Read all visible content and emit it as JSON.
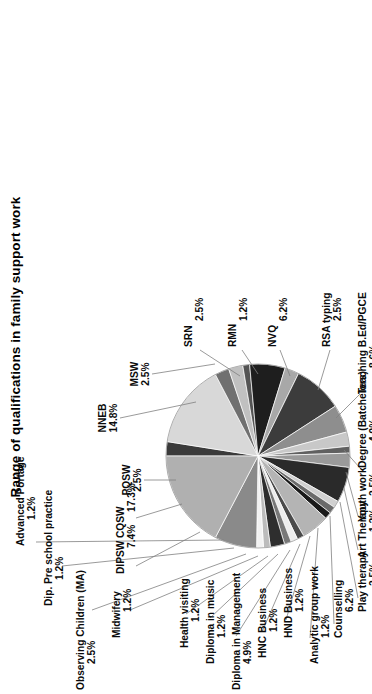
{
  "chart_data": {
    "type": "pie",
    "title": "Range of qualifications in family support work",
    "xlabel": "",
    "ylabel": "",
    "legend_position": "none",
    "grid": false,
    "labels_show_percent": true,
    "rotation_degrees": -90,
    "categories": [
      "PQSW",
      "NNEB",
      "MSW",
      "SRN",
      "RMN",
      "NVQ",
      "RSA typing",
      "Teaching B.Ed/PGCE",
      "Degree (Batchelors)",
      "Youth work",
      "Art Therapy",
      "Play therapy",
      "Counselling",
      "Analytic group work",
      "HND Business",
      "HNC Business",
      "Diploma in Management",
      "Diploma in music",
      "Health visiting",
      "Midwifery",
      "Observing Children (MA)",
      "Dip. Pre school practice",
      "Advanced Portage",
      "DIPSW",
      "CQSW"
    ],
    "values": [
      2.5,
      14.8,
      2.5,
      2.5,
      1.2,
      6.2,
      2.5,
      8.6,
      4.9,
      2.5,
      1.2,
      2.5,
      6.2,
      1.2,
      1.2,
      1.2,
      4.9,
      1.2,
      1.2,
      1.2,
      2.5,
      1.2,
      1.2,
      7.4,
      17.3
    ],
    "value_suffix": "%",
    "slices": [
      {
        "label": "PQSW",
        "value": 2.5,
        "pct_text": "2.5%",
        "color": "#3a3a3a"
      },
      {
        "label": "NNEB",
        "value": 14.8,
        "pct_text": "14.8%",
        "color": "#d8d8d8"
      },
      {
        "label": "MSW",
        "value": 2.5,
        "pct_text": "2.5%",
        "color": "#707070"
      },
      {
        "label": "SRN",
        "value": 2.5,
        "pct_text": "2.5%",
        "color": "#c0c0c0"
      },
      {
        "label": "RMN",
        "value": 1.2,
        "pct_text": "1.2%",
        "color": "#545454"
      },
      {
        "label": "NVQ",
        "value": 6.2,
        "pct_text": "6.2%",
        "color": "#1e1e1e"
      },
      {
        "label": "RSA typing",
        "value": 2.5,
        "pct_text": "2.5%",
        "color": "#a8a8a8"
      },
      {
        "label": "Teaching B.Ed/PGCE",
        "value": 8.6,
        "pct_text": "8.6%",
        "color": "#3c3c3c"
      },
      {
        "label": "Degree (Batchelors)",
        "value": 4.9,
        "pct_text": "4.9%",
        "color": "#8e8e8e"
      },
      {
        "label": "Youth work",
        "value": 2.5,
        "pct_text": "2.5%",
        "color": "#c8c8c8"
      },
      {
        "label": "Art Therapy",
        "value": 1.2,
        "pct_text": "1.2%",
        "color": "#606060"
      },
      {
        "label": "Play therapy",
        "value": 2.5,
        "pct_text": "2.5%",
        "color": "#9a9a9a"
      },
      {
        "label": "Counselling",
        "value": 6.2,
        "pct_text": "6.2%",
        "color": "#2a2a2a"
      },
      {
        "label": "Analytic group work",
        "value": 1.2,
        "pct_text": "1.2%",
        "color": "#d0d0d0"
      },
      {
        "label": "HND Business",
        "value": 1.2,
        "pct_text": "1.2%",
        "color": "#6a6a6a"
      },
      {
        "label": "HNC Business",
        "value": 1.2,
        "pct_text": "1.2%",
        "color": "#1a1a1a"
      },
      {
        "label": "Diploma in Management",
        "value": 4.9,
        "pct_text": "4.9%",
        "color": "#b4b4b4"
      },
      {
        "label": "Diploma in music",
        "value": 1.2,
        "pct_text": "1.2%",
        "color": "#4a4a4a"
      },
      {
        "label": "Health visiting",
        "value": 1.2,
        "pct_text": "1.2%",
        "color": "#ededed"
      },
      {
        "label": "Midwifery",
        "value": 1.2,
        "pct_text": "1.2%",
        "color": "#787878"
      },
      {
        "label": "Observing Children (MA)",
        "value": 2.5,
        "pct_text": "2.5%",
        "color": "#2e2e2e"
      },
      {
        "label": "Dip. Pre school practice",
        "value": 1.2,
        "pct_text": "1.2%",
        "color": "#bcbcbc"
      },
      {
        "label": "Advanced Portage",
        "value": 1.2,
        "pct_text": "1.2%",
        "color": "#f2f2f2"
      },
      {
        "label": "DIPSW",
        "value": 7.4,
        "pct_text": "7.4%",
        "color": "#8a8a8a"
      },
      {
        "label": "CQSW",
        "value": 17.3,
        "pct_text": "17.3%",
        "color": "#b0b0b0"
      }
    ]
  },
  "labels": [
    {
      "id": "pqsw",
      "name": "PQSW",
      "pct": "2.5%",
      "x": 214,
      "y": 130,
      "anchor": "middle",
      "lx1": 214,
      "ly1": 144,
      "lx2": 214,
      "ly2": 176
    },
    {
      "id": "nneb",
      "name": "NNEB",
      "pct": "14.8%",
      "x": 276,
      "y": 106,
      "anchor": "middle",
      "lx1": 276,
      "ly1": 120,
      "lx2": 292,
      "ly2": 196
    },
    {
      "id": "msw",
      "name": "MSW",
      "pct": "2.5%",
      "x": 320,
      "y": 138,
      "anchor": "middle",
      "lx1": 320,
      "ly1": 152,
      "lx2": 330,
      "ly2": 215
    },
    {
      "id": "srn",
      "name": "SRN",
      "pct": "2.5%",
      "x": 347,
      "y": 192,
      "anchor": "start",
      "lx1": 344,
      "ly1": 200,
      "lx2": 318,
      "ly2": 240
    },
    {
      "id": "rmn",
      "name": "RMN",
      "pct": "1.2%",
      "x": 347,
      "y": 236,
      "anchor": "start",
      "lx1": 344,
      "ly1": 242,
      "lx2": 320,
      "ly2": 258
    },
    {
      "id": "nvq",
      "name": "NVQ",
      "pct": "6.2%",
      "x": 347,
      "y": 276,
      "anchor": "start",
      "lx1": 344,
      "ly1": 280,
      "lx2": 318,
      "ly2": 290
    },
    {
      "id": "rsa-typing",
      "name": "RSA typing",
      "pct": "2.5%",
      "x": 347,
      "y": 330,
      "anchor": "start",
      "lx1": 344,
      "ly1": 330,
      "lx2": 304,
      "ly2": 318
    },
    {
      "id": "teaching",
      "name": "Teaching B.Ed/PGCE",
      "pct": "8.6%",
      "x": 300,
      "y": 366,
      "anchor": "start",
      "lx1": 300,
      "ly1": 360,
      "lx2": 276,
      "ly2": 336
    },
    {
      "id": "degree",
      "name": "Degree (Batchelors)",
      "pct": "4.9%",
      "x": 226,
      "y": 366,
      "anchor": "start",
      "lx1": 226,
      "ly1": 360,
      "lx2": 244,
      "ly2": 344
    },
    {
      "id": "youth-work",
      "name": "Youth work",
      "pct": "2.5%",
      "x": 172,
      "y": 366,
      "anchor": "start",
      "lx1": 178,
      "ly1": 358,
      "lx2": 222,
      "ly2": 346
    },
    {
      "id": "art-therapy",
      "name": "Art Therapy",
      "pct": "1.2%",
      "x": 136,
      "y": 366,
      "anchor": "start",
      "lx1": 144,
      "ly1": 358,
      "lx2": 206,
      "ly2": 344
    },
    {
      "id": "play-therapy",
      "name": "Play therapy",
      "pct": "2.5%",
      "x": 82,
      "y": 366,
      "anchor": "start",
      "lx1": 96,
      "ly1": 358,
      "lx2": 192,
      "ly2": 340
    },
    {
      "id": "counselling",
      "name": "Counselling",
      "pct": "6.2%",
      "x": 56,
      "y": 342,
      "anchor": "start",
      "lx1": 70,
      "ly1": 334,
      "lx2": 178,
      "ly2": 330
    },
    {
      "id": "analytic",
      "name": "Analytic group work",
      "pct": "1.2%",
      "x": 30,
      "y": 318,
      "anchor": "start",
      "lx1": 56,
      "ly1": 310,
      "lx2": 166,
      "ly2": 318
    },
    {
      "id": "hnd-business",
      "name": "HND Business",
      "pct": "1.2%",
      "x": 56,
      "y": 292,
      "anchor": "start",
      "lx1": 74,
      "ly1": 286,
      "lx2": 158,
      "ly2": 310
    },
    {
      "id": "hnc-business",
      "name": "HNC Business",
      "pct": "1.2%",
      "x": 36,
      "y": 266,
      "anchor": "start",
      "lx1": 62,
      "ly1": 262,
      "lx2": 150,
      "ly2": 300
    },
    {
      "id": "dip-management",
      "name": "Diploma in Management",
      "pct": "4.9%",
      "x": 4,
      "y": 240,
      "anchor": "start",
      "lx1": 58,
      "ly1": 236,
      "lx2": 144,
      "ly2": 290
    },
    {
      "id": "dip-music",
      "name": "Diploma in music",
      "pct": "1.2%",
      "x": 30,
      "y": 214,
      "anchor": "start",
      "lx1": 76,
      "ly1": 210,
      "lx2": 140,
      "ly2": 278
    },
    {
      "id": "health-visiting",
      "name": "Health visiting",
      "pct": "1.2%",
      "x": 46,
      "y": 188,
      "anchor": "start",
      "lx1": 80,
      "ly1": 186,
      "lx2": 138,
      "ly2": 268
    },
    {
      "id": "midwifery",
      "name": "Midwifery",
      "pct": "1.2%",
      "x": 56,
      "y": 120,
      "anchor": "start",
      "lx1": 84,
      "ly1": 130,
      "lx2": 138,
      "ly2": 258
    },
    {
      "id": "observing",
      "name": "Observing Children (MA)",
      "pct": "2.5%",
      "x": 4,
      "y": 84,
      "anchor": "start",
      "lx1": 84,
      "ly1": 92,
      "lx2": 140,
      "ly2": 246
    },
    {
      "id": "dip-preschool",
      "name": "Dip. Pre school practice",
      "pct": "1.2%",
      "x": 88,
      "y": 52,
      "anchor": "start",
      "lx1": 128,
      "ly1": 62,
      "lx2": 146,
      "ly2": 234
    },
    {
      "id": "adv-portage",
      "name": "Advanced Portage",
      "pct": "1.2%",
      "x": 148,
      "y": 24,
      "anchor": "start",
      "lx1": 152,
      "ly1": 36,
      "lx2": 154,
      "ly2": 224
    },
    {
      "id": "dipsw",
      "name": "DIPSW",
      "pct": "7.4%",
      "x": 120,
      "y": 124,
      "anchor": "start",
      "lx1": 128,
      "ly1": 136,
      "lx2": 162,
      "ly2": 200
    },
    {
      "id": "cqsw",
      "name": "CQSW",
      "pct": "17.3%",
      "x": 156,
      "y": 124,
      "anchor": "start",
      "lx1": 176,
      "ly1": 136,
      "lx2": 190,
      "ly2": 182
    }
  ],
  "geometry": {
    "cx": 238,
    "cy": 258,
    "r": 92,
    "start_angle_deg": -90
  }
}
